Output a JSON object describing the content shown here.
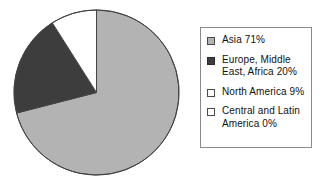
{
  "chart_data": {
    "type": "pie",
    "title": "",
    "categories": [
      "Asia",
      "Europe, Middle East, Africa",
      "North America",
      "Central and Latin America"
    ],
    "values": [
      71,
      20,
      9,
      0
    ],
    "value_unit": "%",
    "start_angle_deg": 0,
    "direction": "clockwise",
    "legend_position": "right",
    "grid": false,
    "slice_colors": [
      "#b3b3b3",
      "#3d3d3d",
      "#ffffff",
      "#ffffff"
    ],
    "slice_outline_color": "#444444",
    "slices": [
      {
        "label": "Asia",
        "value": 71,
        "color": "#b3b3b3",
        "start_deg": 0,
        "end_deg": 255.6,
        "legend_text": "Asia 71%"
      },
      {
        "label": "Europe, Middle East, Africa",
        "value": 20,
        "color": "#3d3d3d",
        "start_deg": 255.6,
        "end_deg": 327.6,
        "legend_text": "Europe, Middle\nEast, Africa 20%"
      },
      {
        "label": "North America",
        "value": 9,
        "color": "#ffffff",
        "start_deg": 327.6,
        "end_deg": 360,
        "legend_text": "North America 9%"
      },
      {
        "label": "Central and Latin America",
        "value": 0,
        "color": "#ffffff",
        "start_deg": 360,
        "end_deg": 360,
        "legend_text": "Central and Latin\nAmerica 0%"
      }
    ]
  },
  "legend": {
    "border_color": "#8a8a8a",
    "background": "#ffffff",
    "items": [
      {
        "swatch_color": "#b3b3b3",
        "swatch_border": "#4a4a4a",
        "text": "Asia 71%"
      },
      {
        "swatch_color": "#3d3d3d",
        "swatch_border": "#2a2a2a",
        "text": "Europe, Middle\nEast, Africa 20%"
      },
      {
        "swatch_color": "#ffffff",
        "swatch_border": "#4a4a4a",
        "text": "North America 9%"
      },
      {
        "swatch_color": "#ffffff",
        "swatch_border": "#4a4a4a",
        "text": "Central and Latin\nAmerica 0%"
      }
    ]
  }
}
